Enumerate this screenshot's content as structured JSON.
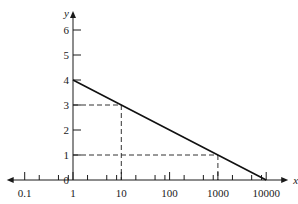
{
  "chart_data": {
    "type": "line",
    "title": "",
    "xlabel": "x",
    "ylabel": "y",
    "x_scale": "log",
    "x_ticks": [
      0.1,
      1,
      10,
      100,
      1000,
      10000
    ],
    "x_tick_labels": [
      "0.1",
      "1",
      "10",
      "100",
      "1000",
      "10000"
    ],
    "x_minor_ticks_per_decade": [
      2,
      5,
      8
    ],
    "y_ticks": [
      0,
      1,
      2,
      3,
      4,
      5,
      6
    ],
    "y_tick_labels": [
      "0",
      "1",
      "2",
      "3",
      "4",
      "5",
      "6"
    ],
    "xlim": [
      0.1,
      10000
    ],
    "ylim": [
      0,
      6
    ],
    "grid": false,
    "legend": null,
    "series": [
      {
        "name": "y = 4 - log10(x)",
        "style": "solid",
        "x": [
          1,
          10,
          1000,
          10000
        ],
        "y": [
          4,
          3,
          1,
          0
        ]
      }
    ],
    "annotations": [
      {
        "type": "dashed-guide",
        "x": 10,
        "y": 3
      },
      {
        "type": "dashed-guide",
        "x": 1000,
        "y": 1
      }
    ]
  },
  "colors": {
    "axis": "#1a1a1a",
    "line": "#111111",
    "guide": "#333333",
    "background": "#ffffff"
  }
}
